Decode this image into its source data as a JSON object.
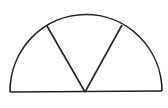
{
  "diagram": {
    "type": "semicircle-sectors",
    "stroke_color": "#222222",
    "background": "#ffffff",
    "center": [
      86,
      91
    ],
    "radius": 76,
    "diameter": {
      "x1": 10,
      "y1": 92,
      "x2": 162,
      "y2": 91
    },
    "spokes": [
      {
        "x1": 85,
        "y1": 92,
        "x2": 47,
        "y2": 26
      },
      {
        "x1": 85,
        "y1": 92,
        "x2": 122,
        "y2": 25
      }
    ],
    "sector_count": 3
  }
}
